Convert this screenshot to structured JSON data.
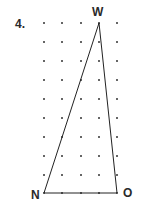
{
  "problem": {
    "number": "4."
  },
  "grid": {
    "columns": 5,
    "rows": 10,
    "x": [
      44,
      62,
      81,
      99,
      117
    ],
    "y": [
      23,
      42,
      61,
      80,
      99,
      118,
      137,
      156,
      175,
      193
    ],
    "dot_color": "#333333"
  },
  "triangle": {
    "vertices": [
      {
        "label": "W",
        "col": 3,
        "row": 0
      },
      {
        "label": "N",
        "col": 0,
        "row": 9
      },
      {
        "label": "O",
        "col": 4,
        "row": 9
      }
    ],
    "stroke_color": "#222222"
  },
  "labels": {
    "w": "W",
    "n": "N",
    "o": "O"
  }
}
